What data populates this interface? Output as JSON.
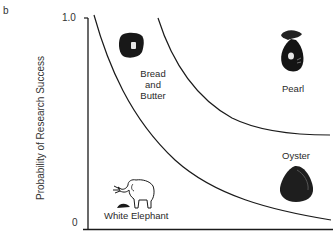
{
  "figure": {
    "panel_letter": "b",
    "y_axis": {
      "title": "Probability of Research Success",
      "tick_top": "1.0",
      "tick_bottom": "0"
    },
    "x_axis": {
      "title": ""
    },
    "colors": {
      "line": "#1a1a1a",
      "icon": "#151515",
      "background": "#ffffff"
    }
  },
  "quadrants": [
    {
      "label": "Bread and Butter",
      "label_lines": [
        "Bread",
        "and",
        "Butter"
      ],
      "icon": "bread-icon"
    },
    {
      "label": "Pearl",
      "icon": "pearl-icon"
    },
    {
      "label": "Oyster",
      "icon": "oyster-icon"
    },
    {
      "label": "White Elephant",
      "icon": "elephant-icon"
    }
  ],
  "curves": [
    {
      "name": "inner-boundary-curve"
    },
    {
      "name": "outer-boundary-curve"
    }
  ]
}
